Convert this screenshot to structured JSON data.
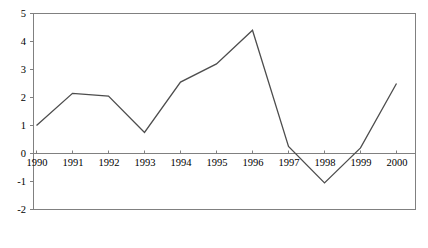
{
  "chart_data": {
    "type": "line",
    "title": "",
    "subtitle": "",
    "xlabel": "",
    "ylabel": "",
    "categories": [
      "1990",
      "1991",
      "1992",
      "1993",
      "1994",
      "1995",
      "1996",
      "1997",
      "1998",
      "1999",
      "2000"
    ],
    "values": [
      1.0,
      2.15,
      2.05,
      0.75,
      2.55,
      3.2,
      4.4,
      0.25,
      -1.05,
      0.2,
      2.5
    ],
    "series": [
      {
        "name": "",
        "values": [
          1.0,
          2.15,
          2.05,
          0.75,
          2.55,
          3.2,
          4.4,
          0.25,
          -1.05,
          0.2,
          2.5
        ]
      }
    ],
    "ylim": [
      -2,
      5
    ],
    "yticks": [
      5,
      4,
      3,
      2,
      1,
      0,
      -1,
      -2
    ],
    "ytick_labels": [
      "5",
      "4",
      "3",
      "2",
      "1",
      "0",
      "-1",
      "-2"
    ],
    "xtick_labels": [
      "1990",
      "1991",
      "1992",
      "1993",
      "1994",
      "1995",
      "1996",
      "1997",
      "1998",
      "1999",
      "2000"
    ],
    "grid": false,
    "legend": "none",
    "zero_line": 0,
    "line_color": "#4d4d4d",
    "axis_color": "#808080",
    "background_color": "#ffffff",
    "annotations": []
  }
}
